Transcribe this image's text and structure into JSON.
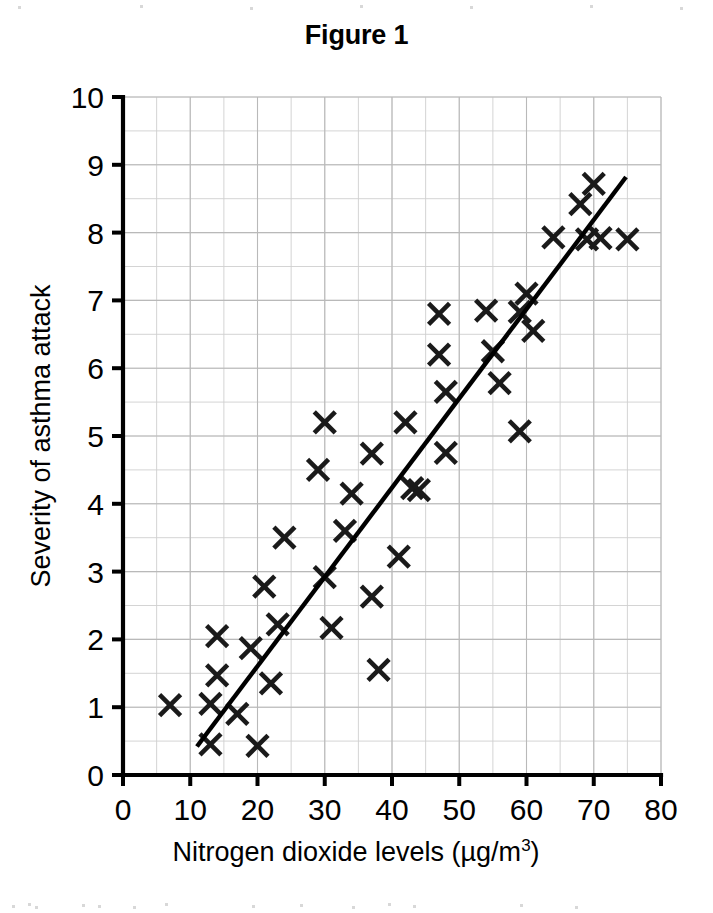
{
  "figure": {
    "title": "Figure 1",
    "background_color": "#ffffff",
    "ink_color": "#000000",
    "grid_color": "#cfcfcf"
  },
  "chart_data": {
    "type": "scatter",
    "title": "Figure 1",
    "xlabel": "Nitrogen dioxide levels (µg/m",
    "xlabel_superscript": "3",
    "xlabel_suffix": ")",
    "ylabel": "Severity of asthma attack",
    "xlim": [
      0,
      80
    ],
    "ylim": [
      0,
      10
    ],
    "xticks": [
      0,
      10,
      20,
      30,
      40,
      50,
      60,
      70,
      80
    ],
    "yticks": [
      0,
      1,
      2,
      3,
      4,
      5,
      6,
      7,
      8,
      9,
      10
    ],
    "x_minor_step": 5,
    "y_minor_step": 0.5,
    "grid": true,
    "legend": "none",
    "marker": "x",
    "points": [
      {
        "x": 7,
        "y": 1.03
      },
      {
        "x": 13,
        "y": 1.05
      },
      {
        "x": 13,
        "y": 0.45
      },
      {
        "x": 14,
        "y": 2.05
      },
      {
        "x": 14,
        "y": 1.47
      },
      {
        "x": 17,
        "y": 0.9
      },
      {
        "x": 19,
        "y": 1.87
      },
      {
        "x": 20,
        "y": 0.43
      },
      {
        "x": 21,
        "y": 2.78
      },
      {
        "x": 22,
        "y": 1.35
      },
      {
        "x": 23,
        "y": 2.22
      },
      {
        "x": 24,
        "y": 3.5
      },
      {
        "x": 29,
        "y": 4.5
      },
      {
        "x": 30,
        "y": 5.2
      },
      {
        "x": 30,
        "y": 2.92
      },
      {
        "x": 31,
        "y": 2.17
      },
      {
        "x": 33,
        "y": 3.6
      },
      {
        "x": 34,
        "y": 4.15
      },
      {
        "x": 37,
        "y": 4.74
      },
      {
        "x": 37,
        "y": 2.63
      },
      {
        "x": 38,
        "y": 1.55
      },
      {
        "x": 41,
        "y": 3.22
      },
      {
        "x": 42,
        "y": 5.2
      },
      {
        "x": 43,
        "y": 4.23
      },
      {
        "x": 44,
        "y": 4.2
      },
      {
        "x": 47,
        "y": 6.8
      },
      {
        "x": 47,
        "y": 6.2
      },
      {
        "x": 48,
        "y": 5.65
      },
      {
        "x": 48,
        "y": 4.75
      },
      {
        "x": 54,
        "y": 6.85
      },
      {
        "x": 55,
        "y": 6.25
      },
      {
        "x": 56,
        "y": 5.78
      },
      {
        "x": 59,
        "y": 5.07
      },
      {
        "x": 59,
        "y": 6.83
      },
      {
        "x": 60,
        "y": 7.1
      },
      {
        "x": 61,
        "y": 6.55
      },
      {
        "x": 64,
        "y": 7.93
      },
      {
        "x": 68,
        "y": 8.42
      },
      {
        "x": 69,
        "y": 7.9
      },
      {
        "x": 70,
        "y": 8.72
      },
      {
        "x": 71,
        "y": 7.92
      },
      {
        "x": 75,
        "y": 7.9
      }
    ],
    "trend_line": {
      "name": "line of best fit",
      "x1": 11.0,
      "y1": 0.42,
      "x2": 74.8,
      "y2": 8.82
    }
  }
}
